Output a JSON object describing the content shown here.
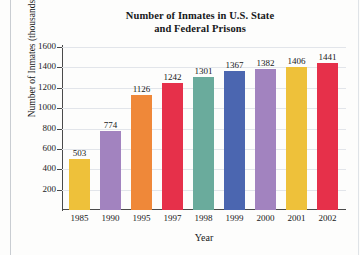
{
  "chart_data": {
    "type": "bar",
    "title": "Number of Inmates in U.S. State and Federal Prisons",
    "title_line1": "Number of Inmates in U.S. State",
    "title_line2": "and Federal Prisons",
    "xlabel": "Year",
    "ylabel": "Number of Inmates (thousands)",
    "categories": [
      "1985",
      "1990",
      "1995",
      "1997",
      "1998",
      "1999",
      "2000",
      "2001",
      "2002"
    ],
    "values": [
      503,
      774,
      1126,
      1242,
      1301,
      1367,
      1382,
      1406,
      1441
    ],
    "ylim": [
      0,
      1600
    ],
    "yticks": [
      1600,
      1400,
      1200,
      1000,
      800,
      600,
      400,
      200
    ],
    "grid": true,
    "legend": null,
    "bar_colors": [
      "#eec13a",
      "#a283bf",
      "#ef8839",
      "#e6304a",
      "#6aab9c",
      "#4b66b0",
      "#a283bf",
      "#eec13a",
      "#e6304a"
    ],
    "data_labels": [
      "503",
      "774",
      "1126",
      "1242",
      "1301",
      "1367",
      "1382",
      "1406",
      "1441"
    ]
  },
  "colors": {
    "axis": "#4a4a4a",
    "grid": "#e2e5ea",
    "text": "#17181a",
    "background": "#fdfdfc"
  }
}
